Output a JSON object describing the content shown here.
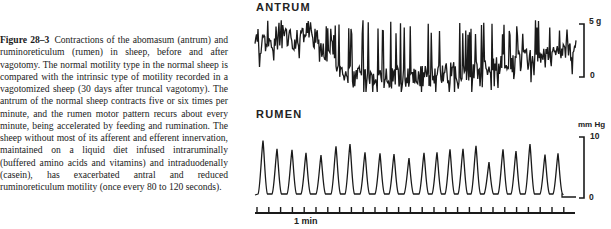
{
  "figure": {
    "label": "Figure 28–3",
    "caption": "Contractions of the abomasum (antrum) and ruminoreticulum (rumen) in sheep, before and after vagotomy. The normal motility type in the normal sheep is compared with the intrinsic type of motility recorded in a vagotomized sheep (30 days after truncal vagotomy). The antrum of the normal sheep contracts five or six times per minute, and the rumen motor pattern recurs about every minute, being accelerated by feeding and rumination. The sheep without most of its afferent and efferent innervation, maintained on a liquid diet infused intraruminally (buffered amino acids and vitamins) and intraduodenally (casein), has exacerbated antral and reduced ruminoreticulum motility (once every 80 to 120 seconds)."
  },
  "panels": {
    "antrum": {
      "title": "ANTRUM",
      "scale_top_label": "5 g",
      "scale_bottom_label": "0"
    },
    "rumen": {
      "title": "RUMEN",
      "unit_label": "mm Hg",
      "scale_top_label": "10",
      "scale_bottom_label": "0"
    },
    "timeline": {
      "label": "1 min"
    }
  },
  "colors": {
    "ink": "#1a1a1a",
    "background": "#ffffff"
  },
  "chart_data": [
    {
      "type": "line",
      "title": "ANTRUM",
      "ylabel": "force (g)",
      "ylim": [
        0,
        5
      ],
      "note": "Synthetic approximation. The original is a dense, irregular strain-gauge trace of high-frequency spikes over a drifting baseline; individual values could not be read at this resolution, so these points are generated to mimic its texture and carry no measured data.",
      "synthetic": true,
      "x_px_range": [
        255,
        576
      ],
      "y_px_range": [
        18,
        92
      ]
    },
    {
      "type": "line",
      "title": "RUMEN",
      "ylabel": "mm Hg",
      "ylim": [
        0,
        10
      ],
      "note": "Peak x positions and relative heights read from the screenshot; the baseline is about 0, and the y values are approximate fractions of full scale.",
      "x_px": [
        263,
        277,
        292,
        306,
        321,
        336,
        350,
        365,
        380,
        394,
        409,
        424,
        437,
        450,
        463,
        476,
        489,
        503,
        516,
        530,
        545,
        558
      ],
      "peak_relative_height": [
        0.92,
        0.78,
        0.76,
        0.71,
        0.67,
        0.82,
        0.86,
        0.72,
        0.7,
        0.69,
        0.62,
        0.71,
        0.72,
        0.77,
        0.78,
        0.83,
        0.55,
        0.77,
        0.74,
        0.86,
        0.68,
        0.7
      ]
    },
    {
      "type": "timeline",
      "label": "1 min",
      "tick_x_start": 257,
      "tick_x_end": 574,
      "tick_spacing_px": 11.8,
      "baseline_y": 213
    }
  ]
}
